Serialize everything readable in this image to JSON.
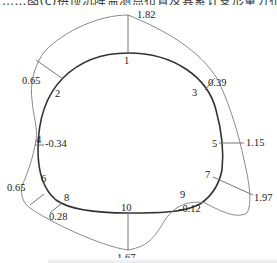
{
  "title_cut": "……图(c)拱顶沉降监测点布置及其累计变形量分布(单位:mm)",
  "diagram": {
    "type": "tunnel-cross-section-deformation",
    "points": [
      {
        "id": "1",
        "value": "1.82"
      },
      {
        "id": "2",
        "value": "0.65"
      },
      {
        "id": "3",
        "value": "0.39"
      },
      {
        "id": "4",
        "value": "-0.34"
      },
      {
        "id": "5",
        "value": "1.15"
      },
      {
        "id": "6",
        "value": "0.65"
      },
      {
        "id": "7",
        "value": "1.97"
      },
      {
        "id": "8",
        "value": "0.28"
      },
      {
        "id": "9",
        "value": "-0.12"
      },
      {
        "id": "10",
        "value": "1.67"
      }
    ],
    "colors": {
      "section": "#333333",
      "envelope": "#8a8a8a",
      "leader": "#666666"
    }
  }
}
